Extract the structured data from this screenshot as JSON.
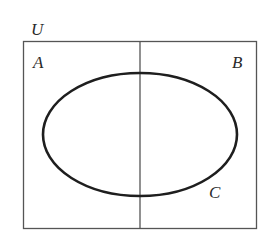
{
  "diagram": {
    "type": "venn",
    "universe_label": "U",
    "sets": [
      {
        "id": "A",
        "label": "A",
        "region": "left half of universe"
      },
      {
        "id": "B",
        "label": "B",
        "region": "right half of universe"
      },
      {
        "id": "C",
        "label": "C",
        "region": "ellipse spanning both halves"
      }
    ],
    "colors": {
      "box_stroke": "#555555",
      "divider_stroke": "#555555",
      "ellipse_stroke": "#1e1e1e",
      "label_fill": "#2a2a2a",
      "background": "#ffffff"
    }
  }
}
